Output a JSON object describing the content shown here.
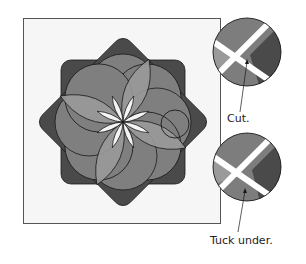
{
  "figure": {
    "type": "quilt-appliqué instruction diagram",
    "main_panel": {
      "subject": "twelve-petal layered flower (overlapping circles) on a square background block",
      "highlight": "small circle marking an overlap area on right side of flower"
    },
    "detail_callouts": [
      {
        "id": "detail-cut",
        "label": "Cut.",
        "description": "magnified overlap with arrow pointing to crossing point"
      },
      {
        "id": "detail-tuck",
        "label": "Tuck under.",
        "description": "magnified overlap with arrow pointing to crossing point"
      }
    ],
    "colors": {
      "background": "#ffffff",
      "block": "#f6f6f6",
      "outline": "#1a1a1a",
      "petal_dark": "#4a4a4a",
      "petal_mid": "#7d7d7d",
      "petal_light": "#9a9a9a",
      "center_gap": "#f4f4f4"
    }
  }
}
